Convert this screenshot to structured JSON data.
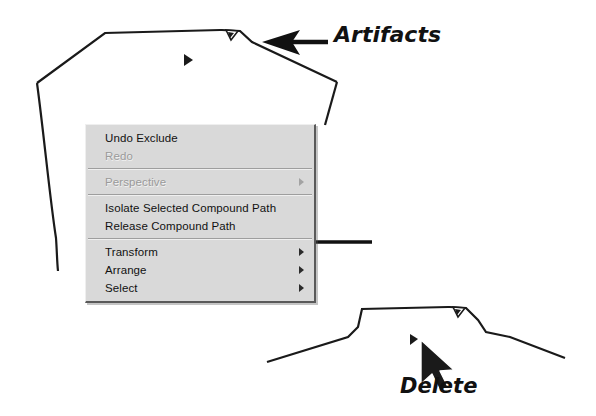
{
  "scene": {
    "title": "Illustrator context menu over garment outline artwork",
    "canvas_background": "#ffffff",
    "line_color": "#1a1a1a"
  },
  "context_menu": {
    "background": "#d9d9d9",
    "text_color": "#111111",
    "disabled_text_color": "#9a9a9a",
    "groups": [
      {
        "items": [
          {
            "label": "Undo Exclude",
            "enabled": true,
            "submenu": false
          },
          {
            "label": "Redo",
            "enabled": false,
            "submenu": false
          }
        ]
      },
      {
        "items": [
          {
            "label": "Perspective",
            "enabled": false,
            "submenu": true
          }
        ]
      },
      {
        "items": [
          {
            "label": "Isolate Selected Compound Path",
            "enabled": true,
            "submenu": false
          },
          {
            "label": "Release Compound Path",
            "enabled": true,
            "submenu": false
          }
        ]
      },
      {
        "items": [
          {
            "label": "Transform",
            "enabled": true,
            "submenu": true
          },
          {
            "label": "Arrange",
            "enabled": true,
            "submenu": true
          },
          {
            "label": "Select",
            "enabled": true,
            "submenu": true
          }
        ]
      }
    ]
  },
  "annotations": {
    "artifacts_label": "Artifacts",
    "delete_label": "Delete",
    "arrow_to_artifacts": "black arrow pointing left at top-right shape artifact",
    "arrow_to_menu_item": "black arrow pointing left at Release Compound Path",
    "cursor": "mouse pointer arrow near lower shape artifact"
  },
  "artwork": {
    "top_shape": "garment / shirt body outline with neckline notch",
    "bottom_shape": "shoulder and neckline outline segment",
    "artifact_marks": [
      {
        "name": "artifact-top-right",
        "x": 231,
        "y": 33
      },
      {
        "name": "artifact-center",
        "x": 187,
        "y": 60
      },
      {
        "name": "artifact-lower-right",
        "x": 458,
        "y": 311
      },
      {
        "name": "artifact-lower-center",
        "x": 413,
        "y": 340
      }
    ]
  }
}
